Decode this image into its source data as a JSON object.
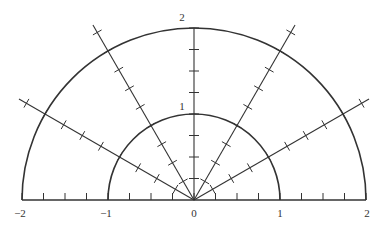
{
  "diagram": {
    "origin_px": [
      194,
      200
    ],
    "unit_px": 86,
    "circles": [
      1,
      2
    ],
    "ray_angles_deg": [
      30,
      60,
      90,
      120,
      150
    ],
    "ray_length": 2.35,
    "tick_spacing": 0.25,
    "axis_range": [
      -2,
      2
    ],
    "stroke_color": "#333333"
  },
  "labels": {
    "x_m2": "−2",
    "x_m1": "−1",
    "x_0": "0",
    "x_1": "1",
    "x_2": "2",
    "y_1": "1",
    "y_2": "2"
  }
}
